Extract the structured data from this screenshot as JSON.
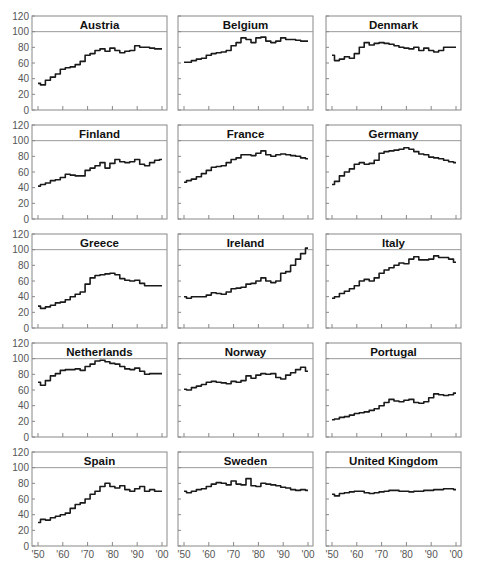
{
  "chart_data": {
    "type": "line",
    "layout": "small-multiples 5x3",
    "ylim": [
      0,
      120
    ],
    "yticks": [
      0,
      20,
      40,
      60,
      80,
      100,
      120
    ],
    "xlim": [
      1950,
      2000
    ],
    "xticks": [
      1950,
      1960,
      1970,
      1980,
      1990,
      2000
    ],
    "xtick_labels": [
      "'50",
      "'60",
      "'70",
      "'80",
      "'90",
      "'00"
    ],
    "reference_line": 100,
    "colors": {
      "line": "#1a1a1a",
      "frame": "#888888",
      "reference": "#999999"
    },
    "x": [
      1950,
      1952,
      1954,
      1956,
      1958,
      1960,
      1962,
      1964,
      1966,
      1968,
      1970,
      1972,
      1974,
      1976,
      1978,
      1980,
      1982,
      1984,
      1986,
      1988,
      1990,
      1992,
      1994,
      1996,
      1998,
      2000
    ],
    "series": [
      {
        "name": "Austria",
        "values": [
          34,
          32,
          38,
          42,
          46,
          52,
          54,
          55,
          58,
          62,
          70,
          72,
          76,
          78,
          75,
          79,
          76,
          73,
          75,
          76,
          82,
          80,
          80,
          79,
          78,
          78
        ]
      },
      {
        "name": "Belgium",
        "values": [
          61,
          61,
          63,
          65,
          66,
          70,
          72,
          73,
          74,
          76,
          82,
          86,
          92,
          90,
          86,
          92,
          93,
          88,
          86,
          88,
          92,
          90,
          90,
          89,
          88,
          88
        ]
      },
      {
        "name": "Denmark",
        "values": [
          70,
          63,
          65,
          68,
          66,
          72,
          80,
          86,
          83,
          85,
          86,
          85,
          84,
          82,
          80,
          79,
          78,
          80,
          76,
          79,
          76,
          74,
          76,
          80,
          80,
          80
        ]
      },
      {
        "name": "Finland",
        "values": [
          42,
          44,
          46,
          49,
          50,
          53,
          57,
          56,
          55,
          55,
          62,
          65,
          68,
          72,
          65,
          71,
          76,
          73,
          72,
          73,
          76,
          70,
          68,
          72,
          75,
          76
        ]
      },
      {
        "name": "France",
        "values": [
          47,
          49,
          51,
          54,
          58,
          62,
          66,
          67,
          68,
          72,
          76,
          78,
          82,
          82,
          81,
          84,
          87,
          82,
          80,
          82,
          83,
          82,
          81,
          80,
          78,
          77
        ]
      },
      {
        "name": "Germany",
        "values": [
          44,
          48,
          55,
          60,
          64,
          70,
          72,
          70,
          71,
          75,
          84,
          86,
          87,
          88,
          89,
          91,
          89,
          86,
          83,
          82,
          79,
          78,
          77,
          75,
          73,
          72
        ]
      },
      {
        "name": "Greece",
        "values": [
          28,
          25,
          27,
          29,
          32,
          33,
          36,
          40,
          43,
          46,
          56,
          64,
          67,
          68,
          69,
          70,
          68,
          63,
          61,
          60,
          61,
          57,
          54,
          54,
          54,
          54
        ]
      },
      {
        "name": "Ireland",
        "values": [
          40,
          38,
          40,
          40,
          40,
          42,
          45,
          44,
          43,
          46,
          50,
          51,
          52,
          56,
          57,
          60,
          64,
          60,
          58,
          60,
          70,
          72,
          80,
          88,
          95,
          102
        ]
      },
      {
        "name": "Italy",
        "values": [
          38,
          40,
          44,
          47,
          50,
          54,
          60,
          62,
          60,
          64,
          70,
          74,
          77,
          80,
          83,
          82,
          88,
          91,
          87,
          87,
          88,
          92,
          90,
          90,
          88,
          84
        ]
      },
      {
        "name": "Netherlands",
        "values": [
          70,
          66,
          72,
          78,
          81,
          85,
          86,
          86,
          87,
          85,
          90,
          93,
          97,
          98,
          96,
          94,
          93,
          90,
          87,
          86,
          88,
          84,
          80,
          81,
          81,
          81
        ]
      },
      {
        "name": "Norway",
        "values": [
          61,
          60,
          63,
          65,
          67,
          70,
          71,
          70,
          69,
          68,
          71,
          70,
          72,
          78,
          75,
          79,
          81,
          80,
          81,
          76,
          74,
          79,
          82,
          86,
          89,
          84
        ]
      },
      {
        "name": "Portugal",
        "values": [
          22,
          23,
          25,
          26,
          28,
          30,
          31,
          32,
          34,
          36,
          40,
          44,
          48,
          46,
          45,
          47,
          48,
          44,
          43,
          45,
          50,
          55,
          54,
          53,
          54,
          56
        ]
      },
      {
        "name": "Spain",
        "values": [
          30,
          34,
          33,
          36,
          38,
          40,
          42,
          48,
          53,
          55,
          60,
          66,
          70,
          76,
          80,
          76,
          74,
          77,
          72,
          70,
          73,
          76,
          70,
          72,
          70,
          70
        ]
      },
      {
        "name": "Sweden",
        "values": [
          70,
          68,
          70,
          72,
          73,
          76,
          79,
          81,
          80,
          78,
          83,
          79,
          78,
          86,
          77,
          76,
          80,
          79,
          78,
          77,
          75,
          74,
          72,
          71,
          72,
          71
        ]
      },
      {
        "name": "United Kingdom",
        "values": [
          66,
          64,
          67,
          68,
          69,
          70,
          70,
          68,
          67,
          68,
          69,
          70,
          71,
          71,
          70,
          70,
          69,
          70,
          70,
          71,
          71,
          72,
          72,
          73,
          73,
          72
        ]
      }
    ]
  }
}
